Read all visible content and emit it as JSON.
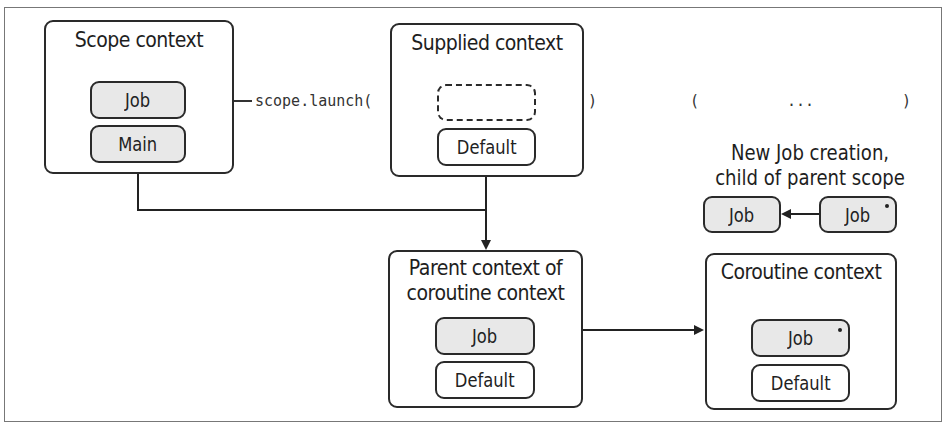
{
  "diagram": {
    "scope_context": {
      "title": "Scope context",
      "elements": [
        {
          "label": "Job",
          "style": "filled"
        },
        {
          "label": "Main",
          "style": "filled"
        }
      ]
    },
    "launch_call": {
      "prefix": "scope.launch(",
      "close_paren": ")",
      "lambda_open": "(",
      "lambda_body": "...",
      "lambda_close": ")"
    },
    "supplied_context": {
      "title": "Supplied context",
      "elements": [
        {
          "label": "",
          "style": "dashed-empty"
        },
        {
          "label": "Default",
          "style": "outline"
        }
      ]
    },
    "new_job_note": {
      "caption_line1": "New Job creation,",
      "caption_line2": "child of parent scope",
      "child_job": {
        "label": "Job",
        "marker": "dot"
      },
      "parent_job": {
        "label": "Job"
      }
    },
    "parent_context": {
      "title_line1": "Parent context of",
      "title_line2": "coroutine context",
      "elements": [
        {
          "label": "Job",
          "style": "filled"
        },
        {
          "label": "Default",
          "style": "outline"
        }
      ]
    },
    "coroutine_context": {
      "title": "Coroutine context",
      "elements": [
        {
          "label": "Job",
          "style": "filled",
          "marker": "dot"
        },
        {
          "label": "Default",
          "style": "outline"
        }
      ]
    },
    "colors": {
      "stroke": "#2a2a2a",
      "filled_pill": "#e8e8e8",
      "frame": "#777777",
      "background": "#ffffff"
    }
  }
}
